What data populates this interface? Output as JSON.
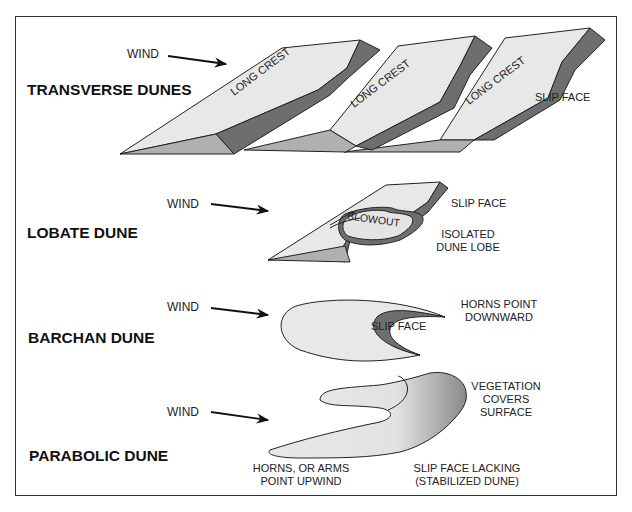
{
  "diagram": {
    "colors": {
      "surface": "#e8e8e8",
      "slip_face": "#6e6e6e",
      "side": "#b0b0b0",
      "outline": "#222222"
    },
    "sections": [
      {
        "title": "TRANSVERSE DUNES",
        "wind_label": "WIND",
        "labels": [
          "LONG CREST",
          "LONG CREST",
          "LONG CREST",
          "SLIP FACE"
        ]
      },
      {
        "title": "LOBATE DUNE",
        "wind_label": "WIND",
        "labels": [
          "BLOWOUT",
          "SLIP FACE",
          "ISOLATED",
          "DUNE LOBE"
        ]
      },
      {
        "title": "BARCHAN DUNE",
        "wind_label": "WIND",
        "labels": [
          "SLIP FACE",
          "HORNS POINT",
          "DOWNWARD"
        ]
      },
      {
        "title": "PARABOLIC DUNE",
        "wind_label": "WIND",
        "labels": [
          "VEGETATION",
          "COVERS",
          "SURFACE",
          "HORNS, OR ARMS",
          "POINT UPWIND",
          "SLIP FACE LACKING",
          "(STABILIZED DUNE)"
        ]
      }
    ]
  }
}
